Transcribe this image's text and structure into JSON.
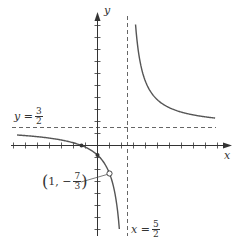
{
  "chart_data": {
    "type": "line",
    "title": "",
    "xlabel": "x",
    "ylabel": "y",
    "function": "f(x) = (3x^2 + x - 4)/(2x^2 - 7x + 5) = (3x+4)/(2x-5), x != 1",
    "xlim": [
      -7,
      10
    ],
    "ylim": [
      -7,
      10
    ],
    "x_ticks": [
      -7,
      -6,
      -5,
      -4,
      -3,
      -2,
      -1,
      1,
      2,
      3,
      4,
      5,
      6,
      7,
      8,
      9,
      10
    ],
    "y_ticks": [
      -7,
      -6,
      -5,
      -4,
      -3,
      -2,
      -1,
      1,
      2,
      3,
      4,
      5,
      6,
      7,
      8,
      9,
      10
    ],
    "tick_labels_shown": false,
    "grid": false,
    "vertical_asymptote": {
      "x": 2.5,
      "label": "x = 5/2"
    },
    "horizontal_asymptote": {
      "y": 1.5,
      "label": "y = 3/2"
    },
    "hole": {
      "x": 1,
      "y": -2.3333,
      "label": "(1, -7/3)"
    },
    "x_intercept": {
      "x": -1.3333,
      "y": 0
    },
    "y_intercept": {
      "x": 0,
      "y": -0.8
    },
    "branches": [
      {
        "name": "left-branch",
        "x_start": -6.7,
        "x_end": 1.82
      },
      {
        "name": "right-branch",
        "x_start": 3.17,
        "x_end": 9.8
      }
    ],
    "colors": {
      "curve": "#555555",
      "axis": "#333333",
      "asymptote": "#555555"
    }
  },
  "labels": {
    "y_axis": "y",
    "x_axis": "x",
    "ha_lhs": "y =",
    "ha_num": "3",
    "ha_den": "2",
    "va_lhs": "x =",
    "va_num": "5",
    "va_den": "2",
    "hole_open": "(",
    "hole_x": "1, −",
    "hole_num": "7",
    "hole_den": "3",
    "hole_close": ")"
  }
}
